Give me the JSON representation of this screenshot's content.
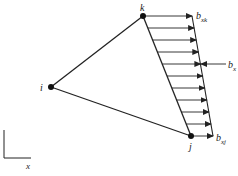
{
  "diagram": {
    "type": "triangular element with linearly varying body force",
    "nodes": [
      {
        "id": "i",
        "label": "i",
        "x": 51,
        "y": 87
      },
      {
        "id": "j",
        "label": "j",
        "x": 191,
        "y": 136
      },
      {
        "id": "k",
        "label": "k",
        "x": 143,
        "y": 16
      }
    ],
    "load": {
      "top_label": "b",
      "top_sub": "xk",
      "bottom_label": "b",
      "bottom_sub": "xj",
      "resultant_label": "b",
      "resultant_sub": "x",
      "arrow_count": 11
    },
    "axes": {
      "x_label": "x"
    },
    "colors": {
      "line": "#222222",
      "background": "#ffffff"
    }
  }
}
